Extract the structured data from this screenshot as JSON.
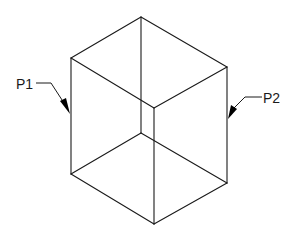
{
  "diagram": {
    "type": "isometric-wireframe-box",
    "line_color": "#1a1a1a",
    "background": "#ffffff",
    "labels": [
      {
        "id": "p1",
        "text": "P1",
        "side": "left"
      },
      {
        "id": "p2",
        "text": "P2",
        "side": "right"
      }
    ]
  }
}
